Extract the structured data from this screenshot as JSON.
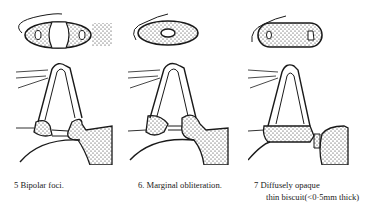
{
  "figure": {
    "panels": [
      {
        "id": "5",
        "caption": "5 Bipolar foci.",
        "caption_line2": ""
      },
      {
        "id": "6",
        "caption": "6. Marginal obliteration.",
        "caption_line2": ""
      },
      {
        "id": "7",
        "caption": "7 Diffusely opaque",
        "caption_line2": "thin biscuit(<0·5mm thick)"
      }
    ]
  },
  "colors": {
    "ink": "#1a1a1a",
    "paper": "#ffffff"
  }
}
